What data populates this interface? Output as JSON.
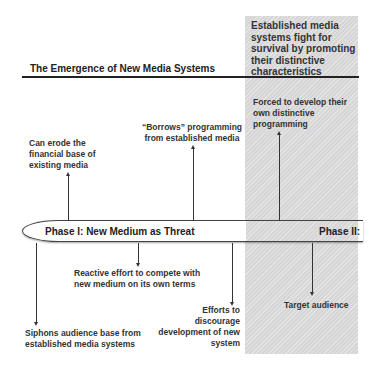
{
  "diagram": {
    "title": "The Emergence of New Media Systems",
    "phase2_panel": {
      "heading": "Established media systems fight for survival by promoting their distinctive characteristics",
      "fill_color": "#d6d6d6"
    },
    "timeline": {
      "phase1_label": "Phase I: New Medium as Threat",
      "phase2_label": "Phase II:"
    },
    "above_notes": [
      {
        "text": "Can erode the financial base of existing media"
      },
      {
        "text": "“Borrows” programming from established media"
      },
      {
        "text": "Forced to develop their own distinctive programming"
      }
    ],
    "below_notes": [
      {
        "text": "Siphons audience base from established media systems"
      },
      {
        "text": "Reactive effort to compete with new medium on its own terms"
      },
      {
        "text": "Efforts to discourage development of new system"
      },
      {
        "text": "Target audience"
      }
    ]
  }
}
